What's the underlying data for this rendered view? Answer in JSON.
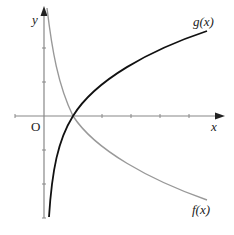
{
  "diagram": {
    "axes": {
      "x_label": "x",
      "y_label": "y",
      "origin_label": "O",
      "axis_color": "#888888"
    },
    "curves": [
      {
        "name": "g",
        "label": "g(x)",
        "color": "#111111",
        "description": "increasing logarithmic curve through (1,0)"
      },
      {
        "name": "f",
        "label": "f(x)",
        "color": "#999999",
        "description": "decreasing logarithmic curve through (1,0)"
      }
    ],
    "intersection": {
      "x": 1,
      "y": 0
    }
  }
}
